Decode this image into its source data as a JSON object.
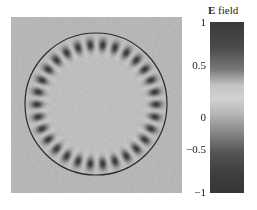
{
  "chart_data": {
    "type": "heatmap",
    "title": "",
    "colorbar": {
      "title_bold": "E",
      "title_rest": " field",
      "ticks": [
        "1",
        "0.5",
        "0",
        "−0.5",
        "−1"
      ],
      "tick_values": [
        1,
        0.5,
        0,
        -0.5,
        -1
      ],
      "range": [
        -1,
        1
      ]
    },
    "field": {
      "lobe_count": 30,
      "circle_boundary": true,
      "background_value": 0.1
    }
  }
}
